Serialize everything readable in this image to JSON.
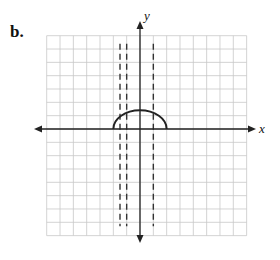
{
  "problem_label": "b.",
  "axes": {
    "x_label": "x",
    "y_label": "y"
  },
  "grid": {
    "columns": 15,
    "rows": 15,
    "origin_px": [
      140,
      129
    ],
    "unit_px": 13.33,
    "x_range": [
      -7,
      8
    ],
    "y_range": [
      -8,
      7
    ],
    "color": "#c8c8c8"
  },
  "curve": {
    "type": "upper-semicircle-like arc",
    "x_start": -2,
    "x_end": 2,
    "peak_y": 1.4,
    "color": "#222222"
  },
  "asymptotes": [
    {
      "x": -1.5,
      "style": "dashed"
    },
    {
      "x": -1,
      "style": "dashed"
    },
    {
      "x": 1,
      "style": "dashed"
    }
  ],
  "colors": {
    "axis": "#222222",
    "dashed": "#333333"
  }
}
